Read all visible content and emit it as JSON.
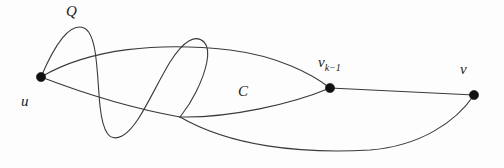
{
  "figure": {
    "background_color": "#fdfdfd",
    "stroke_color": "#3a3a3a",
    "node_color": "#111111",
    "width": 504,
    "height": 168
  },
  "labels": {
    "q": "Q",
    "u": "u",
    "c": "C",
    "v_k_minus_1_base": "v",
    "v_k_minus_1_sub": "k−1",
    "v": "v"
  },
  "nodes": [
    {
      "id": "u",
      "label": "u",
      "x": 41,
      "y": 77,
      "r": 4.6
    },
    {
      "id": "vk1",
      "label": "v",
      "x": 330,
      "y": 88,
      "r": 4.6
    },
    {
      "id": "v",
      "label": "v",
      "x": 474,
      "y": 95,
      "r": 4.6
    }
  ],
  "edges": [
    {
      "id": "q-wave",
      "name": "path-Q-wavy-curve",
      "from": "u",
      "to": "branch",
      "path": "M 41 77 C 55 44 70 22 84 28 C 98 34 97 78 100 106 C 103 134 110 142 122 136 C 138 128 152 92 170 62 C 184 40 196 34 204 42 C 212 50 206 72 196 92 C 188 108 182 114 180 117"
    },
    {
      "id": "top-arc",
      "name": "upper-arc-u-to-vk1",
      "from": "u",
      "to": "vk1",
      "path": "M 41 77 C 90 48 160 42 230 50 C 278 56 312 74 330 88"
    },
    {
      "id": "mid-arc",
      "name": "middle-arc-u-to-branch",
      "from": "u",
      "to": "branch",
      "path": "M 41 77 C 80 92 130 108 180 117"
    },
    {
      "id": "branch-to-vk1",
      "name": "lower-arc-branch-to-vk1",
      "from": "branch",
      "to": "vk1",
      "path": "M 180 117 C 230 118 292 104 330 88"
    },
    {
      "id": "branch-to-v",
      "name": "long-bottom-curve-branch-to-v",
      "from": "branch",
      "to": "v",
      "path": "M 180 117 C 230 146 300 154 370 150 C 420 146 456 122 474 95"
    },
    {
      "id": "vk1-to-v",
      "name": "straight-edge-vk1-to-v",
      "from": "vk1",
      "to": "v",
      "path": "M 330 88 L 474 95"
    }
  ]
}
